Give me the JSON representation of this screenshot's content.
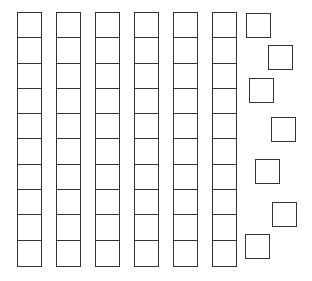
{
  "diagram": {
    "type": "base-ten-blocks",
    "tens_rods": 6,
    "ones_units": 7,
    "represented_value": 67,
    "cells_per_rod": 10,
    "stroke_color": "#333333",
    "background": "#ffffff",
    "rods": [
      {
        "x": 17,
        "y": 12
      },
      {
        "x": 56,
        "y": 12
      },
      {
        "x": 95,
        "y": 12
      },
      {
        "x": 134,
        "y": 12
      },
      {
        "x": 173,
        "y": 12
      },
      {
        "x": 212,
        "y": 12
      }
    ],
    "units": [
      {
        "x": 246,
        "y": 13
      },
      {
        "x": 268,
        "y": 45
      },
      {
        "x": 249,
        "y": 78
      },
      {
        "x": 271,
        "y": 117
      },
      {
        "x": 255,
        "y": 159
      },
      {
        "x": 272,
        "y": 202
      },
      {
        "x": 245,
        "y": 234
      }
    ]
  }
}
